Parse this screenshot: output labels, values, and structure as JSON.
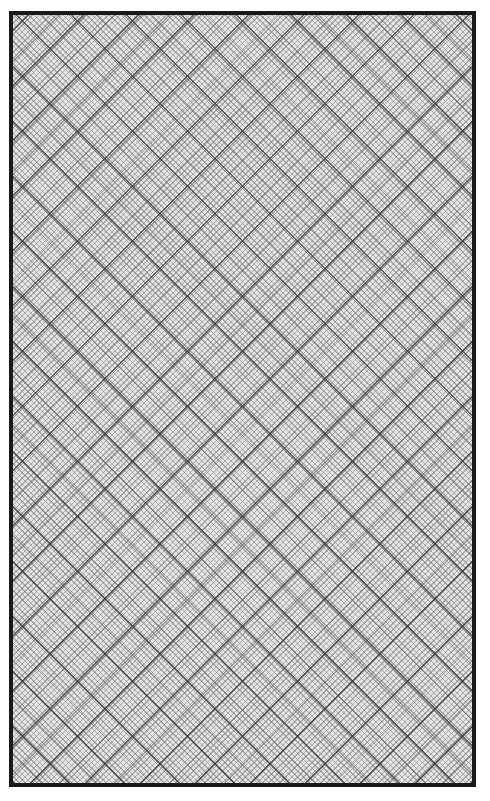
{
  "page": {
    "width": 490,
    "height": 801,
    "background_color": "#ffffff"
  },
  "frame": {
    "name": "hatched-panel",
    "left": 9,
    "top": 11,
    "width": 467,
    "height": 776,
    "border_color": "#1a1a1a",
    "border_width": 4,
    "fill_color": "#e4e4e4"
  },
  "pattern": {
    "type": "diagonal-cross-hatch",
    "angles_deg": [
      45,
      -45
    ],
    "layers": [
      {
        "name": "fine",
        "pitch_px": 4.1,
        "line_width_px": 1,
        "color": "#787878",
        "opacity": 0.55,
        "note": "tight hatching in both diagonal directions; reads as a small checkerboard"
      },
      {
        "name": "medium",
        "pitch_px": 19.4,
        "line_width_px": 1.2,
        "color": "#5a5a5a",
        "opacity": 0.5,
        "note": "secondary diagonals falling midway between the bold lattice lines"
      },
      {
        "name": "bold",
        "pitch_px": 38.9,
        "line_width_px": 1.6,
        "color": "#373737",
        "opacity": 0.72,
        "note": "dominant diamond lattice, about 55 px apart measured horizontally"
      }
    ]
  }
}
